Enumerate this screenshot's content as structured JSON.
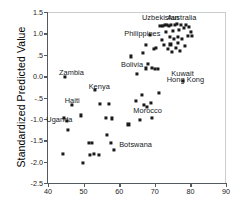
{
  "chart_data": {
    "type": "scatter",
    "title": "",
    "xlabel": "",
    "ylabel": "Standardized Predicted Value",
    "xlim": [
      40,
      90
    ],
    "ylim": [
      -2.5,
      1.5
    ],
    "xticks": [
      40,
      50,
      60,
      70,
      80,
      90
    ],
    "xtick_labels": [
      "40",
      "50",
      "60",
      "70",
      "80",
      "90"
    ],
    "yticks": [
      1.5,
      1.0,
      0.5,
      0.0,
      -0.5,
      -1.0,
      -1.5,
      -2.0,
      -2.5
    ],
    "ytick_labels": [
      "1.5",
      "1.0",
      ".5",
      "0.0",
      "-.5",
      "-1.0",
      "-1.5",
      "-2.0",
      "-2.5"
    ],
    "grid": false,
    "legend": null,
    "marker": "square",
    "marker_color": "#1a1a1a",
    "points": [
      [
        44.1,
        -1.83
      ],
      [
        44.6,
        -0.97
      ],
      [
        44.8,
        -0.02
      ],
      [
        45.2,
        -1.04
      ],
      [
        45.7,
        -1.26
      ],
      [
        46.8,
        -0.67
      ],
      [
        49.2,
        -0.92
      ],
      [
        49.8,
        -2.04
      ],
      [
        51.6,
        -1.57
      ],
      [
        51.9,
        -1.84
      ],
      [
        52.3,
        -1.56
      ],
      [
        52.8,
        -1.83
      ],
      [
        53.2,
        -0.33
      ],
      [
        54.2,
        -1.84
      ],
      [
        54.6,
        -0.66
      ],
      [
        56.2,
        -0.98
      ],
      [
        56.5,
        -1.37
      ],
      [
        57.0,
        -0.66
      ],
      [
        57.6,
        -1.56
      ],
      [
        57.9,
        -0.99
      ],
      [
        58.4,
        -1.72
      ],
      [
        62.6,
        -1.13
      ],
      [
        63.2,
        0.46
      ],
      [
        64.8,
        -0.59
      ],
      [
        65.1,
        0.05
      ],
      [
        65.9,
        -1.02
      ],
      [
        66.3,
        -0.43
      ],
      [
        66.7,
        0.54
      ],
      [
        66.9,
        -0.68
      ],
      [
        67.4,
        0.73
      ],
      [
        67.6,
        0.18
      ],
      [
        67.8,
        -0.72
      ],
      [
        68.2,
        0.28
      ],
      [
        68.6,
        0.97
      ],
      [
        68.8,
        -0.62
      ],
      [
        69.1,
        0.19
      ],
      [
        69.3,
        -0.98
      ],
      [
        69.8,
        0.63
      ],
      [
        70.1,
        0.17
      ],
      [
        70.4,
        0.66
      ],
      [
        70.9,
        0.17
      ],
      [
        71.2,
        -0.4
      ],
      [
        71.6,
        1.18
      ],
      [
        71.9,
        0.84
      ],
      [
        72.3,
        1.17
      ],
      [
        72.6,
        0.72
      ],
      [
        72.9,
        1.19
      ],
      [
        73.1,
        1.04
      ],
      [
        73.4,
        1.2
      ],
      [
        73.6,
        0.63
      ],
      [
        73.9,
        1.18
      ],
      [
        74.2,
        0.91
      ],
      [
        74.4,
        0.74
      ],
      [
        74.6,
        1.2
      ],
      [
        74.9,
        0.56
      ],
      [
        75.2,
        1.05
      ],
      [
        75.4,
        0.88
      ],
      [
        75.7,
        1.2
      ],
      [
        75.9,
        0.66
      ],
      [
        76.2,
        1.21
      ],
      [
        76.4,
        0.92
      ],
      [
        76.6,
        0.78
      ],
      [
        76.9,
        1.07
      ],
      [
        77.1,
        0.59
      ],
      [
        77.4,
        1.19
      ],
      [
        77.6,
        0.87
      ],
      [
        77.9,
        -0.11
      ],
      [
        78.2,
        1.12
      ],
      [
        78.4,
        0.7
      ],
      [
        78.7,
        1.2
      ],
      [
        79.2,
        0.93
      ],
      [
        79.6,
        1.16
      ],
      [
        80.1,
        1.04
      ],
      [
        80.4,
        0.95
      ]
    ],
    "annotations": [
      {
        "label": "Uzbekistan",
        "x": 71.6,
        "y": 1.38
      },
      {
        "label": "Australia",
        "x": 77.6,
        "y": 1.38
      },
      {
        "label": "Philippines",
        "x": 66.5,
        "y": 1.02
      },
      {
        "label": "Bolivia",
        "x": 63.6,
        "y": 0.28
      },
      {
        "label": "Kuwait",
        "x": 77.8,
        "y": 0.08
      },
      {
        "label": "Hong Kong",
        "x": 78.6,
        "y": -0.06
      },
      {
        "label": "Zambia",
        "x": 46.6,
        "y": 0.1
      },
      {
        "label": "Kenya",
        "x": 54.4,
        "y": -0.24
      },
      {
        "label": "Haiti",
        "x": 46.8,
        "y": -0.55
      },
      {
        "label": "Uganda",
        "x": 43.2,
        "y": -1.0
      },
      {
        "label": "Morocco",
        "x": 68.0,
        "y": -0.8
      },
      {
        "label": "Botswana",
        "x": 64.6,
        "y": -1.58
      }
    ]
  }
}
